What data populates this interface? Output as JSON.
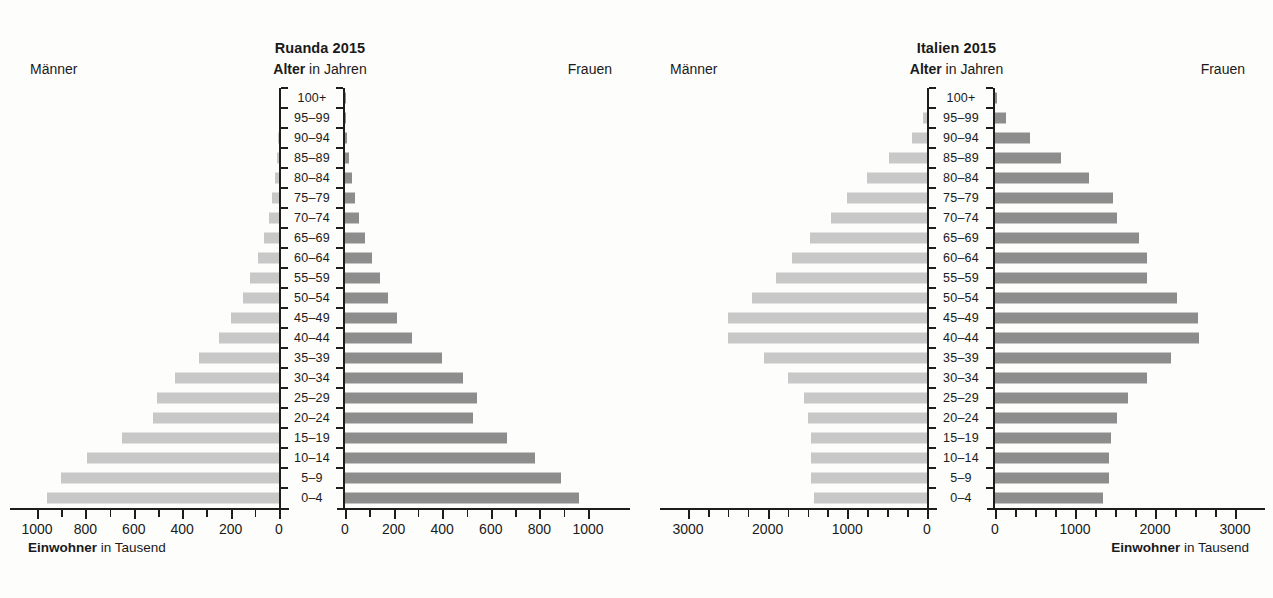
{
  "figure": {
    "axis_caption_bold": "Einwohner",
    "axis_caption_rest": " in Tausend",
    "subtitle_bold": "Alter",
    "subtitle_rest": " in Jahren",
    "label_men": "Männer",
    "label_women": "Frauen",
    "colors": {
      "men_bar": "#c8c8c8",
      "women_bar": "#8d8d8d",
      "axis": "#1d1d1d",
      "background": "#fdfdfb",
      "text": "#1a1a1a"
    }
  },
  "age_groups": [
    "100+",
    "95–99",
    "90–94",
    "85–89",
    "80–84",
    "75–79",
    "70–74",
    "65–69",
    "60–64",
    "55–59",
    "50–54",
    "45–49",
    "40–44",
    "35–39",
    "30–34",
    "25–29",
    "20–24",
    "15–19",
    "10–14",
    "5–9",
    "0–4"
  ],
  "chart_data": [
    {
      "type": "bar",
      "subtype": "population-pyramid",
      "title": "Ruanda 2015",
      "xlabel": "Einwohner in Tausend",
      "ylabel": "Alter in Jahren",
      "categories": [
        "100+",
        "95–99",
        "90–94",
        "85–89",
        "80–84",
        "75–79",
        "70–74",
        "65–69",
        "60–64",
        "55–59",
        "50–54",
        "45–49",
        "40–44",
        "35–39",
        "30–34",
        "25–29",
        "20–24",
        "15–19",
        "10–14",
        "5–9",
        "0–4"
      ],
      "series": [
        {
          "name": "Männer",
          "side": "left",
          "values": [
            0.4,
            2,
            5,
            10,
            18,
            28,
            40,
            62,
            88,
            120,
            150,
            200,
            250,
            330,
            430,
            505,
            520,
            650,
            795,
            900,
            960
          ]
        },
        {
          "name": "Frauen",
          "side": "right",
          "values": [
            0.6,
            3,
            8,
            16,
            28,
            42,
            58,
            82,
            110,
            145,
            175,
            215,
            275,
            400,
            485,
            545,
            525,
            665,
            780,
            890,
            965
          ]
        }
      ],
      "xlim": [
        0,
        1000
      ],
      "xticks_major": [
        0,
        200,
        400,
        600,
        800,
        1000
      ],
      "xtick_labels_left": [
        "1000",
        "800",
        "600",
        "400",
        "200",
        "0"
      ],
      "xtick_labels_right": [
        "0",
        "200",
        "400",
        "600",
        "800",
        "1000"
      ],
      "xtick_minor_step": 100,
      "grid": false,
      "legend": "none"
    },
    {
      "type": "bar",
      "subtype": "population-pyramid",
      "title": "Italien 2015",
      "xlabel": "Einwohner in Tausend",
      "ylabel": "Alter in Jahren",
      "categories": [
        "100+",
        "95–99",
        "90–94",
        "85–89",
        "80–84",
        "75–79",
        "70–74",
        "65–69",
        "60–64",
        "55–59",
        "50–54",
        "45–49",
        "40–44",
        "35–39",
        "30–34",
        "25–29",
        "20–24",
        "15–19",
        "10–14",
        "5–9",
        "0–4"
      ],
      "series": [
        {
          "name": "Männer",
          "side": "left",
          "values": [
            5,
            50,
            190,
            480,
            750,
            1000,
            1200,
            1470,
            1700,
            1900,
            2200,
            2500,
            2500,
            2050,
            1750,
            1550,
            1500,
            1450,
            1450,
            1450,
            1420
          ]
        },
        {
          "name": "Frauen",
          "side": "right",
          "values": [
            20,
            140,
            440,
            830,
            1180,
            1480,
            1530,
            1800,
            1900,
            1900,
            2280,
            2540,
            2550,
            2200,
            1900,
            1660,
            1520,
            1450,
            1420,
            1420,
            1350
          ]
        }
      ],
      "xlim": [
        0,
        3000
      ],
      "xticks_major": [
        0,
        1000,
        2000,
        3000
      ],
      "xtick_labels_left": [
        "3000",
        "2000",
        "1000",
        "0"
      ],
      "xtick_labels_right": [
        "0",
        "1000",
        "2000",
        "3000"
      ],
      "xtick_minor_step": 250,
      "grid": false,
      "legend": "none"
    }
  ]
}
